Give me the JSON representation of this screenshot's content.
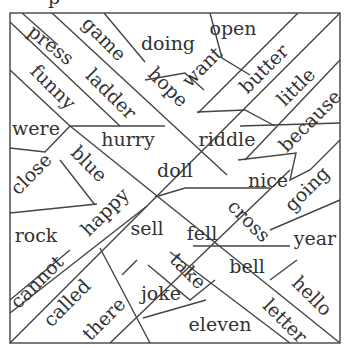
{
  "puzzle": {
    "title_fragment": "p",
    "border_color": "#444444",
    "text_color": "#333333",
    "words": [
      {
        "text": "press",
        "x": 50,
        "y": 46,
        "rot": 38
      },
      {
        "text": "game",
        "x": 103,
        "y": 40,
        "rot": 45
      },
      {
        "text": "doing",
        "x": 168,
        "y": 45,
        "rot": 0
      },
      {
        "text": "open",
        "x": 233,
        "y": 30,
        "rot": 0
      },
      {
        "text": "funny",
        "x": 52,
        "y": 88,
        "rot": 45
      },
      {
        "text": "ladder",
        "x": 110,
        "y": 95,
        "rot": 45
      },
      {
        "text": "hope",
        "x": 167,
        "y": 88,
        "rot": 45
      },
      {
        "text": "want",
        "x": 203,
        "y": 68,
        "rot": -45
      },
      {
        "text": "butter",
        "x": 265,
        "y": 70,
        "rot": -45
      },
      {
        "text": "little",
        "x": 297,
        "y": 88,
        "rot": -45
      },
      {
        "text": "were",
        "x": 36,
        "y": 130,
        "rot": 0
      },
      {
        "text": "hurry",
        "x": 128,
        "y": 141,
        "rot": 0
      },
      {
        "text": "riddle",
        "x": 227,
        "y": 141,
        "rot": 0
      },
      {
        "text": "because",
        "x": 311,
        "y": 122,
        "rot": -45
      },
      {
        "text": "close",
        "x": 32,
        "y": 175,
        "rot": -45
      },
      {
        "text": "blue",
        "x": 88,
        "y": 165,
        "rot": 45
      },
      {
        "text": "doll",
        "x": 175,
        "y": 172,
        "rot": 0
      },
      {
        "text": "nice",
        "x": 268,
        "y": 182,
        "rot": 0
      },
      {
        "text": "going",
        "x": 308,
        "y": 190,
        "rot": -45
      },
      {
        "text": "rock",
        "x": 36,
        "y": 237,
        "rot": 0
      },
      {
        "text": "happy",
        "x": 106,
        "y": 213,
        "rot": -45
      },
      {
        "text": "sell",
        "x": 147,
        "y": 230,
        "rot": 0
      },
      {
        "text": "fell",
        "x": 202,
        "y": 235,
        "rot": 0
      },
      {
        "text": "cross",
        "x": 248,
        "y": 222,
        "rot": 45
      },
      {
        "text": "year",
        "x": 315,
        "y": 240,
        "rot": 0
      },
      {
        "text": "cannot",
        "x": 38,
        "y": 283,
        "rot": -45
      },
      {
        "text": "take",
        "x": 187,
        "y": 272,
        "rot": 45
      },
      {
        "text": "bell",
        "x": 247,
        "y": 268,
        "rot": 0
      },
      {
        "text": "hello",
        "x": 311,
        "y": 297,
        "rot": 45
      },
      {
        "text": "called",
        "x": 68,
        "y": 304,
        "rot": -45
      },
      {
        "text": "joke",
        "x": 161,
        "y": 295,
        "rot": 0
      },
      {
        "text": "letter",
        "x": 284,
        "y": 322,
        "rot": 45
      },
      {
        "text": "there",
        "x": 105,
        "y": 320,
        "rot": -45
      },
      {
        "text": "eleven",
        "x": 220,
        "y": 326,
        "rot": 0
      }
    ]
  }
}
